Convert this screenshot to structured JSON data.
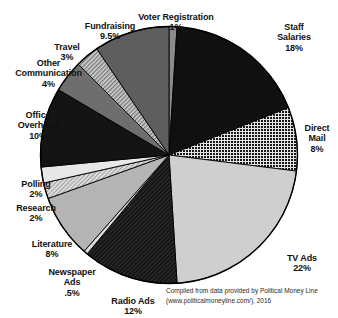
{
  "chart_data": {
    "type": "pie",
    "title": "",
    "subtitle": "",
    "xlabel": "",
    "ylabel": "",
    "legend_position": "none",
    "grid": false,
    "start_angle_deg": 0,
    "direction": "clockwise",
    "categories": [
      "Voter Registration",
      "Staff Salaries",
      "Direct Mail",
      "TV Ads",
      "Radio Ads",
      "Newspaper Ads",
      "Literature",
      "Research",
      "Polling",
      "Office Overhead",
      "Other Communication",
      "Travel",
      "Fundraising"
    ],
    "values": [
      1,
      18,
      8,
      22,
      12,
      0.5,
      8,
      2,
      2,
      10,
      4,
      3,
      9.5
    ],
    "value_labels": [
      "1%",
      "18%",
      "8%",
      "22%",
      "12%",
      ".5%",
      "8%",
      "2%",
      "2%",
      "10%",
      "4%",
      "3%",
      "9.5%"
    ],
    "units": "percent",
    "slices": [
      {
        "name": "Voter Registration",
        "label": "Voter Registration",
        "value": 1,
        "value_label": "1%",
        "fill": "#8c8c8c",
        "pattern": "solid"
      },
      {
        "name": "Staff Salaries",
        "label": "Staff\nSalaries",
        "value": 18,
        "value_label": "18%",
        "fill": "#101010",
        "pattern": "solid"
      },
      {
        "name": "Direct Mail",
        "label": "Direct\nMail",
        "value": 8,
        "value_label": "8%",
        "fill": "#1f1f1f",
        "pattern": "checker"
      },
      {
        "name": "TV Ads",
        "label": "TV Ads",
        "value": 22,
        "value_label": "22%",
        "fill": "#cfcfcf",
        "pattern": "solid"
      },
      {
        "name": "Radio Ads",
        "label": "Radio Ads",
        "value": 12,
        "value_label": "12%",
        "fill": "#262626",
        "pattern": "diagonal-dark"
      },
      {
        "name": "Newspaper Ads",
        "label": "Newspaper\nAds",
        "value": 0.5,
        "value_label": ".5%",
        "fill": "#dcdcdc",
        "pattern": "solid"
      },
      {
        "name": "Literature",
        "label": "Literature",
        "value": 8,
        "value_label": "8%",
        "fill": "#b4b4b4",
        "pattern": "solid"
      },
      {
        "name": "Research",
        "label": "Research",
        "value": 2,
        "value_label": "2%",
        "fill": "#c4c4c4",
        "pattern": "diagonal-light"
      },
      {
        "name": "Polling",
        "label": "Polling",
        "value": 2,
        "value_label": "2%",
        "fill": "#e8e8e8",
        "pattern": "solid"
      },
      {
        "name": "Office Overhead",
        "label": "Office\nOverhead",
        "value": 10,
        "value_label": "10%",
        "fill": "#141414",
        "pattern": "solid"
      },
      {
        "name": "Other Communication",
        "label": "Other\nCommunication",
        "value": 4,
        "value_label": "4%",
        "fill": "#6e6e6e",
        "pattern": "solid"
      },
      {
        "name": "Travel",
        "label": "Travel",
        "value": 3,
        "value_label": "3%",
        "fill": "#9a9a9a",
        "pattern": "diagonal-mid"
      },
      {
        "name": "Fundraising",
        "label": "Fundraising",
        "value": 9.5,
        "value_label": "9.5%",
        "fill": "#5e5e5e",
        "pattern": "solid"
      }
    ]
  },
  "labels": {
    "voter_registration": {
      "name": "Voter Registration",
      "pct": "1%"
    },
    "staff_salaries": {
      "name": "Staff\nSalaries",
      "pct": "18%"
    },
    "direct_mail": {
      "name": "Direct\nMail",
      "pct": "8%"
    },
    "tv_ads": {
      "name": "TV Ads",
      "pct": "22%"
    },
    "radio_ads": {
      "name": "Radio Ads",
      "pct": "12%"
    },
    "newspaper_ads": {
      "name": "Newspaper\nAds",
      "pct": ".5%"
    },
    "literature": {
      "name": "Literature",
      "pct": "8%"
    },
    "research": {
      "name": "Research",
      "pct": "2%"
    },
    "polling": {
      "name": "Polling",
      "pct": "2%"
    },
    "office_overhead": {
      "name": "Office\nOverhead",
      "pct": "10%"
    },
    "other_communication": {
      "name": "Other\nCommunication",
      "pct": "4%"
    },
    "travel": {
      "name": "Travel",
      "pct": "3%"
    },
    "fundraising": {
      "name": "Fundraising",
      "pct": "9.5%"
    }
  },
  "source": {
    "text": "Compiled from data provided by Political Money Line (www.politicalmoneyline.com/), 2016"
  },
  "colors": {
    "background": "#ffffff",
    "text": "#111111",
    "outline": "#000000"
  }
}
